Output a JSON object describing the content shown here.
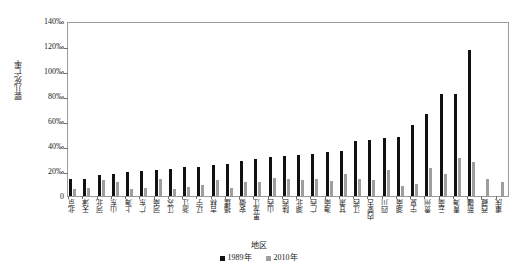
{
  "chart_data": {
    "type": "bar",
    "title": "",
    "xlabel": "地区",
    "ylabel": "婴儿死亡率",
    "ylim": [
      0,
      140
    ],
    "yunit": "‰",
    "grid": false,
    "legend_position": "bottom",
    "ytick_labels": [
      "140‰",
      "120‰",
      "100‰",
      "80‰",
      "60‰",
      "40‰",
      "20‰",
      "0"
    ],
    "ytick_values": [
      140,
      120,
      100,
      80,
      60,
      40,
      20,
      0
    ],
    "categories": [
      "北京",
      "天津",
      "河北",
      "山东",
      "上海",
      "广东",
      "河南",
      "江苏",
      "浙江",
      "辽宁",
      "吉林",
      "福建",
      "安徽",
      "黑龙江",
      "山西",
      "陕西",
      "湖北",
      "广西",
      "海南",
      "甘肃",
      "江西",
      "内蒙古",
      "四川",
      "湖南",
      "宁夏",
      "贵州",
      "云南",
      "青海",
      "新疆",
      "西藏",
      "重庆"
    ],
    "series": [
      {
        "name": "1989年",
        "color": "#111111",
        "values": [
          13.5,
          14.0,
          16.5,
          17.5,
          19.0,
          20.0,
          21.0,
          22.0,
          23.0,
          23.5,
          24.5,
          26.0,
          28.0,
          30.0,
          31.0,
          32.0,
          33.0,
          34.0,
          35.0,
          36.0,
          44.0,
          44.5,
          46.5,
          47.0,
          56.5,
          66.0,
          82.0,
          82.0,
          117.0,
          0,
          0
        ]
      },
      {
        "name": "2010年",
        "color": "#9e9e9e",
        "values": [
          6.0,
          6.5,
          13.0,
          11.5,
          5.5,
          6.5,
          14.0,
          6.0,
          7.0,
          8.5,
          13.0,
          6.5,
          11.5,
          11.0,
          14.5,
          14.0,
          12.5,
          14.0,
          12.0,
          17.5,
          13.5,
          13.0,
          20.5,
          8.0,
          9.5,
          22.5,
          18.0,
          30.5,
          27.0,
          13.5,
          11.0
        ]
      }
    ],
    "legend": [
      {
        "label": "1989年",
        "color": "#111111"
      },
      {
        "label": "2010年",
        "color": "#9e9e9e"
      }
    ]
  }
}
